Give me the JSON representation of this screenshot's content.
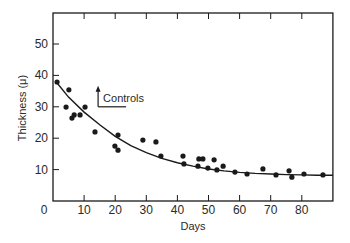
{
  "chart_data": {
    "type": "scatter",
    "title": "",
    "xlabel": "Days",
    "ylabel": "Thickness (μ)",
    "xlim": [
      0,
      90
    ],
    "ylim": [
      0,
      59
    ],
    "x_ticks": [
      0,
      10,
      20,
      30,
      40,
      50,
      60,
      70,
      80
    ],
    "x_tick_labels": [
      "0",
      "10",
      "20",
      "30",
      "40",
      "50",
      "60",
      "70",
      "80"
    ],
    "y_ticks": [
      10,
      20,
      30,
      40,
      50
    ],
    "y_tick_labels": [
      "10",
      "20",
      "30",
      "40",
      "50"
    ],
    "grid": false,
    "legend": null,
    "series": [
      {
        "name": "observations",
        "marker": "filled-circle",
        "points": [
          [
            1.3,
            37.9
          ],
          [
            4.2,
            29.9
          ],
          [
            5.1,
            35.4
          ],
          [
            6.1,
            26.4
          ],
          [
            6.8,
            27.4
          ],
          [
            8.7,
            27.4
          ],
          [
            10.3,
            29.9
          ],
          [
            13.5,
            22.0
          ],
          [
            19.9,
            17.5
          ],
          [
            20.9,
            16.2
          ],
          [
            20.9,
            21.0
          ],
          [
            28.9,
            19.4
          ],
          [
            33.1,
            18.8
          ],
          [
            34.7,
            14.3
          ],
          [
            41.8,
            14.3
          ],
          [
            42.1,
            11.8
          ],
          [
            46.6,
            11.1
          ],
          [
            46.9,
            13.4
          ],
          [
            48.2,
            13.4
          ],
          [
            49.8,
            10.5
          ],
          [
            51.8,
            13.1
          ],
          [
            52.7,
            9.9
          ],
          [
            54.7,
            11.1
          ],
          [
            58.5,
            9.2
          ],
          [
            62.4,
            8.6
          ],
          [
            67.5,
            10.2
          ],
          [
            71.7,
            8.3
          ],
          [
            75.9,
            9.6
          ],
          [
            76.8,
            7.6
          ],
          [
            80.7,
            8.6
          ],
          [
            86.8,
            8.3
          ]
        ]
      },
      {
        "name": "fitted curve",
        "type": "line",
        "points": [
          [
            1,
            38.0
          ],
          [
            5,
            33.1
          ],
          [
            10,
            28.3
          ],
          [
            15,
            24.3
          ],
          [
            20,
            20.6
          ],
          [
            25,
            17.6
          ],
          [
            30,
            15.4
          ],
          [
            35,
            13.6
          ],
          [
            40,
            12.2
          ],
          [
            45,
            11.1
          ],
          [
            50,
            10.2
          ],
          [
            55,
            9.6
          ],
          [
            60,
            9.1
          ],
          [
            65,
            8.8
          ],
          [
            70,
            8.6
          ],
          [
            75,
            8.4
          ],
          [
            80,
            8.3
          ],
          [
            85,
            8.2
          ],
          [
            90,
            8.2
          ]
        ]
      }
    ],
    "annotations": [
      {
        "text": "Controls",
        "x": 16,
        "y": 32,
        "arrow": "up",
        "line_from_day": 14.5,
        "line_to_day": 23.5,
        "line_y": 30
      }
    ]
  },
  "labels": {
    "ylabel": "Thickness (μ)",
    "xlabel": "Days",
    "annotation": "Controls",
    "x0": "0"
  },
  "colors": {
    "ink": "#1a1a1a",
    "background": "#ffffff"
  }
}
